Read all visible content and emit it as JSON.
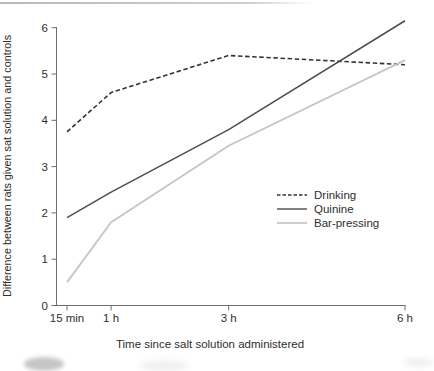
{
  "artifacts": {
    "top_rule_color": "#bdbdbd",
    "blob_color": "#c6c6c6"
  },
  "chart_data": {
    "type": "line",
    "title": "",
    "xlabel": "Time since salt solution administered",
    "ylabel": "Difference between rats given sat solution and controls",
    "x_hours": [
      0.25,
      1,
      3,
      6
    ],
    "x_tick_labels": [
      "15 min",
      "1 h",
      "3 h",
      "6 h"
    ],
    "y_ticks": [
      0,
      1,
      2,
      3,
      4,
      5,
      6
    ],
    "ylim": [
      0,
      6.4
    ],
    "xlim_hours": [
      0.05,
      6.5
    ],
    "grid": false,
    "legend_position": "center-right",
    "series": [
      {
        "name": "Drinking",
        "line_style": "dashed",
        "color": "#333333",
        "values": [
          3.75,
          4.6,
          5.4,
          5.2
        ]
      },
      {
        "name": "Quinine",
        "line_style": "solid",
        "color": "#4d4d4d",
        "values": [
          1.9,
          2.45,
          3.8,
          6.15
        ]
      },
      {
        "name": "Bar-pressing",
        "line_style": "solid",
        "color": "#c5c5c5",
        "values": [
          0.5,
          1.8,
          3.45,
          5.3
        ]
      }
    ]
  }
}
